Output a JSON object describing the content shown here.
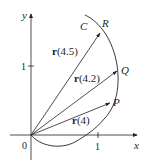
{
  "figure": {
    "axes": {
      "x_label": "x",
      "y_label": "y",
      "origin_label": "0",
      "x_tick_label": "1",
      "y_tick_label": "1"
    },
    "curve": {
      "label": "C"
    },
    "points": [
      {
        "name": "R",
        "label": "R"
      },
      {
        "name": "Q",
        "label": "Q"
      },
      {
        "name": "P",
        "label": "P"
      }
    ],
    "vectors": [
      {
        "func": "r",
        "arg": "(4.5)",
        "to": "R"
      },
      {
        "func": "r",
        "arg": "(4.2)",
        "to": "Q"
      },
      {
        "func": "r",
        "arg": "(4)",
        "to": "P"
      }
    ],
    "colors": {
      "ink": "#231f20",
      "axis": "#231f20"
    }
  }
}
